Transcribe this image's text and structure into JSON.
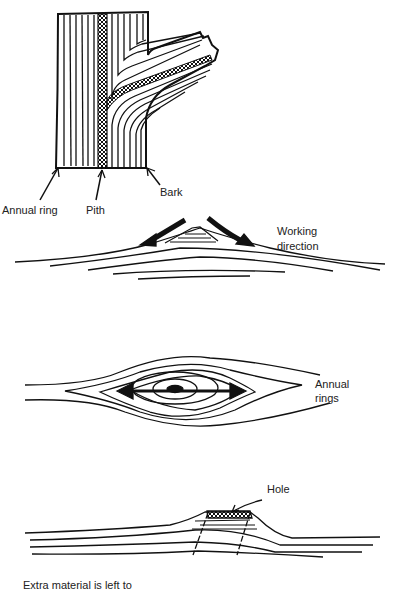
{
  "figure1": {
    "labels": {
      "annual_ring": "Annual ring",
      "pith": "Pith",
      "bark": "Bark"
    }
  },
  "figure2": {
    "label_line1": "Working",
    "label_line2": "direction"
  },
  "figure3": {
    "label_line1": "Annual",
    "label_line2": "rings"
  },
  "figure4": {
    "hole_label": "Hole"
  },
  "caption": "Extra material is left to",
  "colors": {
    "ink": "#111111",
    "background": "#ffffff"
  }
}
